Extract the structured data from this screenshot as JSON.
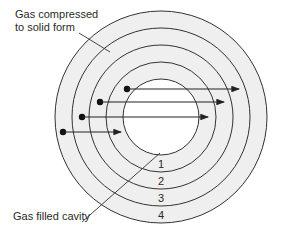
{
  "labels": {
    "top": [
      "Gas compressed",
      "to solid form"
    ],
    "bottom": "Gas filled cavity"
  },
  "rings": [
    "1",
    "2",
    "3",
    "4"
  ],
  "colors": {
    "ring_fill": "#efefef",
    "cavity_fill": "#ffffff",
    "stroke": "#333333"
  }
}
